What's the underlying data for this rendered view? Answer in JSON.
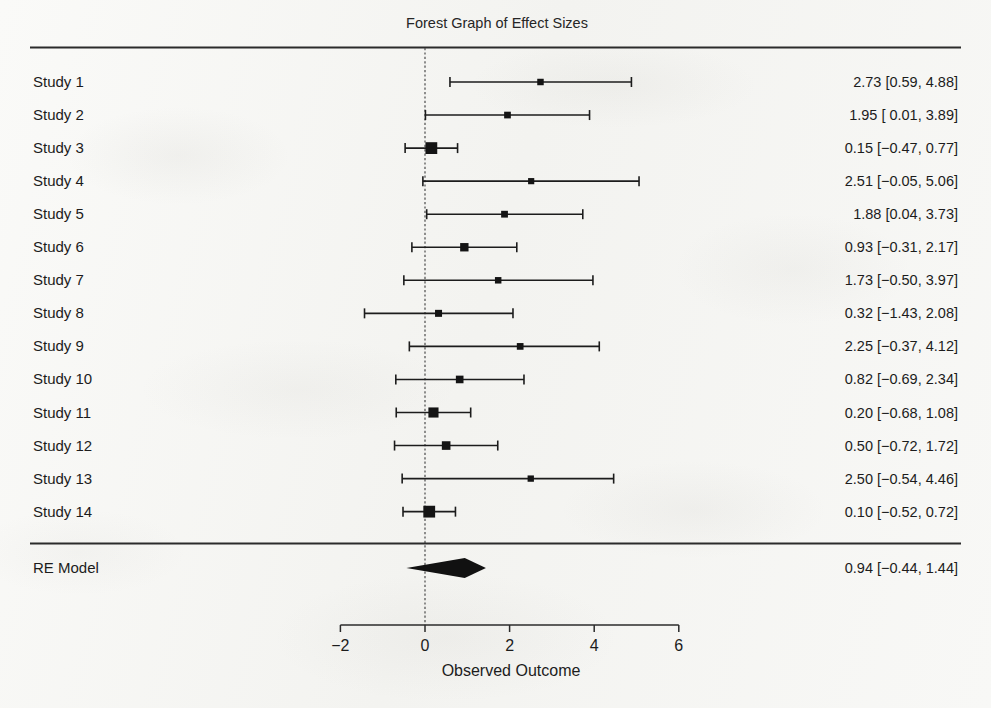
{
  "figure": {
    "title": "Forest Graph of Effect Sizes",
    "axis_title": "Observed Outcome",
    "summary_row_label": "RE Model"
  },
  "chart_data": {
    "type": "forest",
    "title": "Forest Graph of Effect Sizes",
    "xlabel": "Observed Outcome",
    "ylabel": "",
    "xlim": [
      -2,
      6
    ],
    "xticks": [
      -2,
      0,
      2,
      4,
      6
    ],
    "xtick_labels": [
      "−2",
      "0",
      "2",
      "4",
      "6"
    ],
    "reference_line": 0,
    "grid": false,
    "legend": "none",
    "columns": [
      "Study",
      "Estimate [95% CI]"
    ],
    "rows": [
      {
        "label": "Study 1",
        "estimate": 2.73,
        "ci_low": 0.59,
        "ci_high": 4.88,
        "weight": 0.3,
        "text": "2.73 [0.59, 4.88]"
      },
      {
        "label": "Study 2",
        "estimate": 1.95,
        "ci_low": 0.01,
        "ci_high": 3.89,
        "weight": 0.33,
        "text": "1.95 [ 0.01, 3.89]"
      },
      {
        "label": "Study 3",
        "estimate": 0.15,
        "ci_low": -0.47,
        "ci_high": 0.77,
        "weight": 1.0,
        "text": "0.15 [−0.47, 0.77]"
      },
      {
        "label": "Study 4",
        "estimate": 2.51,
        "ci_low": -0.05,
        "ci_high": 5.06,
        "weight": 0.26,
        "text": "2.51 [−0.05, 5.06]"
      },
      {
        "label": "Study 5",
        "estimate": 1.88,
        "ci_low": 0.04,
        "ci_high": 3.73,
        "weight": 0.34,
        "text": "1.88 [0.04, 3.73]"
      },
      {
        "label": "Study 6",
        "estimate": 0.93,
        "ci_low": -0.31,
        "ci_high": 2.17,
        "weight": 0.55,
        "text": "0.93 [−0.31, 2.17]"
      },
      {
        "label": "Study 7",
        "estimate": 1.73,
        "ci_low": -0.5,
        "ci_high": 3.97,
        "weight": 0.3,
        "text": "1.73 [−0.50, 3.97]"
      },
      {
        "label": "Study 8",
        "estimate": 0.32,
        "ci_low": -1.43,
        "ci_high": 2.08,
        "weight": 0.37,
        "text": "0.32 [−1.43, 2.08]"
      },
      {
        "label": "Study 9",
        "estimate": 2.25,
        "ci_low": -0.37,
        "ci_high": 4.12,
        "weight": 0.33,
        "text": "2.25 [−0.37, 4.12]"
      },
      {
        "label": "Study 10",
        "estimate": 0.82,
        "ci_low": -0.69,
        "ci_high": 2.34,
        "weight": 0.45,
        "text": "0.82 [−0.69, 2.34]"
      },
      {
        "label": "Study 11",
        "estimate": 0.2,
        "ci_low": -0.68,
        "ci_high": 1.08,
        "weight": 0.78,
        "text": "0.20 [−0.68, 1.08]"
      },
      {
        "label": "Study 12",
        "estimate": 0.5,
        "ci_low": -0.72,
        "ci_high": 1.72,
        "weight": 0.58,
        "text": "0.50 [−0.72, 1.72]"
      },
      {
        "label": "Study 13",
        "estimate": 2.5,
        "ci_low": -0.54,
        "ci_high": 4.46,
        "weight": 0.28,
        "text": "2.50 [−0.54, 4.46]"
      },
      {
        "label": "Study 14",
        "estimate": 0.1,
        "ci_low": -0.52,
        "ci_high": 0.72,
        "weight": 1.0,
        "text": "0.10 [−0.52, 0.72]"
      }
    ],
    "summary": {
      "label": "RE Model",
      "estimate": 0.94,
      "ci_low": -0.44,
      "ci_high": 1.44,
      "text": "0.94 [−0.44, 1.44]"
    }
  },
  "colors": {
    "ink": "#1c1c1c",
    "rule": "#2b2b2b",
    "marker": "#141414",
    "paper": "#f7f7f5"
  }
}
